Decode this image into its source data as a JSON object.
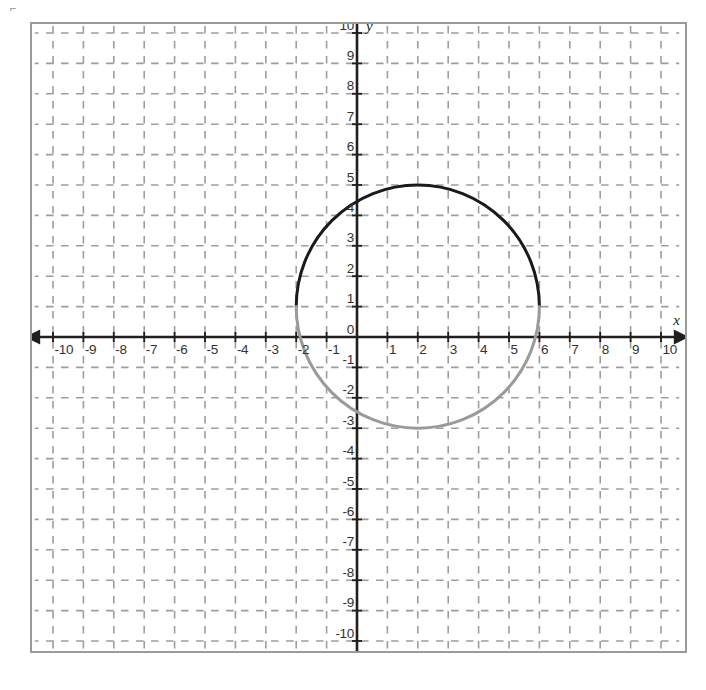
{
  "page": {
    "corner_mark": "⌐",
    "background_color": "#ffffff",
    "frame_color": "#9a9a9a"
  },
  "axes": {
    "x_axis_label": "x",
    "y_axis_label": "y",
    "axis_color": "#201f1d",
    "grid_color": "#9d9d9d",
    "origin_label": "0"
  },
  "chart_data": {
    "type": "scatter",
    "title": "",
    "xlabel": "x",
    "ylabel": "y",
    "xlim": [
      -10.8,
      10.8
    ],
    "ylim": [
      -10.8,
      10.8
    ],
    "grid": true,
    "grid_style": "dashed",
    "grid_step": 1,
    "legend": "none",
    "x_ticks": [
      -10,
      -9,
      -8,
      -7,
      -6,
      -5,
      -4,
      -3,
      -2,
      -1,
      1,
      2,
      3,
      4,
      5,
      6,
      7,
      8,
      9,
      10
    ],
    "y_ticks": [
      10,
      9,
      8,
      7,
      6,
      5,
      4,
      3,
      2,
      1,
      0,
      -1,
      -2,
      -3,
      -4,
      -5,
      -6,
      -7,
      -8,
      -9,
      -10
    ],
    "x_tick_labels": [
      "-10",
      "-9",
      "-8",
      "-7",
      "-6",
      "-5",
      "-4",
      "-3",
      "-2",
      "-1",
      "1",
      "2",
      "3",
      "4",
      "5",
      "6",
      "7",
      "8",
      "9",
      "10"
    ],
    "y_tick_labels": [
      "10",
      "9",
      "8",
      "7",
      "6",
      "5",
      "4",
      "3",
      "2",
      "1",
      "0",
      "-1",
      "-2",
      "-3",
      "-4",
      "-5",
      "-6",
      "-7",
      "-8",
      "-9",
      "-10"
    ],
    "shapes": [
      {
        "kind": "circle",
        "name": "graphed-circle",
        "center_x": 2,
        "center_y": 1,
        "radius": 4,
        "equation": "(x - 2)^2 + (y - 1)^2 = 16",
        "leftmost_x": -2,
        "rightmost_x": 6,
        "top_y": 5,
        "bottom_y": -3,
        "upper_arc_color": "#1a1a1a",
        "lower_arc_color": "#9a9a9a",
        "stroke_width": 3
      }
    ]
  }
}
